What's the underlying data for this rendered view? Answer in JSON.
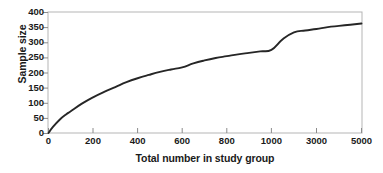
{
  "chart_data": {
    "type": "line",
    "title": "",
    "xlabel": "Total number in study group",
    "ylabel": "Sample size",
    "ylim": [
      0,
      400
    ],
    "yticks": [
      0,
      50,
      100,
      150,
      200,
      250,
      300,
      350,
      400
    ],
    "ytick_labels": [
      "0",
      "50",
      "100",
      "150",
      "200",
      "250",
      "300",
      "350",
      "400"
    ],
    "xticks": [
      0,
      200,
      400,
      600,
      800,
      1000,
      3000,
      5000
    ],
    "xtick_labels": [
      "0",
      "200",
      "400",
      "600",
      "800",
      "1000",
      "3000",
      "5000"
    ],
    "x_axis_scale": "piecewise-uniform",
    "grid": false,
    "legend": null,
    "series": [
      {
        "name": "Required sample size",
        "color": "#262626",
        "x": [
          0,
          20,
          50,
          80,
          100,
          150,
          200,
          250,
          300,
          350,
          400,
          450,
          500,
          550,
          600,
          650,
          700,
          750,
          800,
          850,
          900,
          950,
          1000,
          1500,
          2000,
          2500,
          3000,
          3500,
          4000,
          4500,
          5000
        ],
        "values": [
          0,
          20,
          44,
          62,
          72,
          97,
          118,
          136,
          152,
          168,
          181,
          192,
          202,
          210,
          217,
          230,
          240,
          248,
          254,
          260,
          265,
          270,
          275,
          310,
          333,
          339,
          344,
          350,
          354,
          358,
          362
        ]
      }
    ]
  },
  "axes": {
    "frame_color": "#b0b0b0",
    "tick_color": "#808080",
    "text_color": "#1a1a1a",
    "background": "#ffffff"
  }
}
